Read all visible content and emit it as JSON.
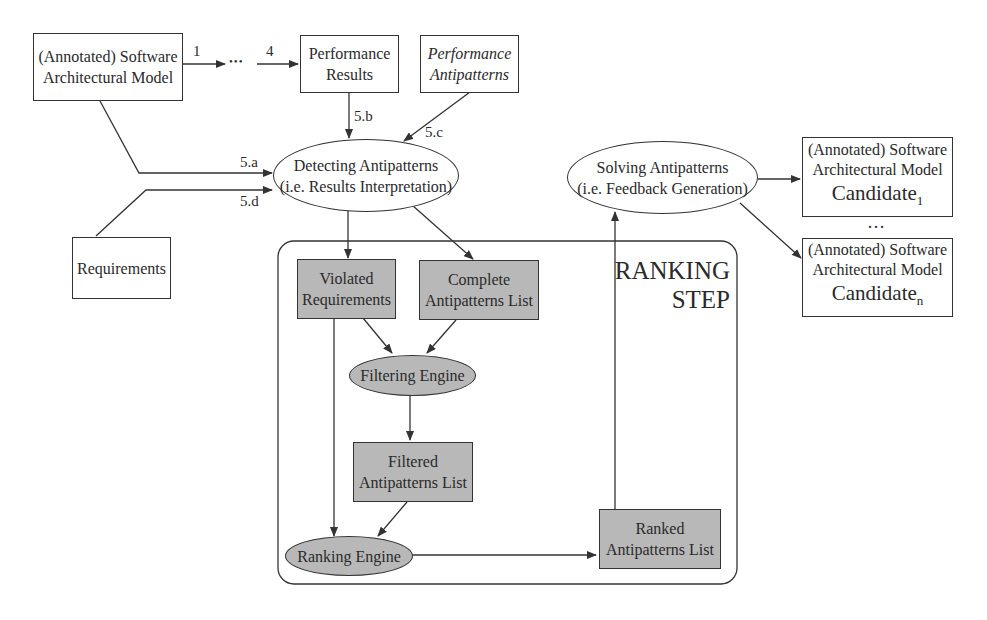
{
  "nodes": {
    "model": {
      "line1": "(Annotated) Software",
      "line2": "Architectural Model"
    },
    "perf_results": {
      "line1": "Performance",
      "line2": "Results"
    },
    "perf_antipatterns": {
      "line1": "Performance",
      "line2": "Antipatterns"
    },
    "detecting": {
      "line1": "Detecting Antipatterns",
      "line2": "(i.e. Results Interpretation)"
    },
    "requirements": {
      "label": "Requirements"
    },
    "solving": {
      "line1": "Solving Antipatterns",
      "line2": "(i.e. Feedback Generation)"
    },
    "candidate1": {
      "line1": "(Annotated) Software",
      "line2": "Architectural Model",
      "name": "Candidate",
      "sub": "1"
    },
    "candidaten": {
      "line1": "(Annotated) Software",
      "line2": "Architectural Model",
      "name": "Candidate",
      "sub": "n"
    },
    "candidate_ellipsis": "…",
    "violated": {
      "line1": "Violated",
      "line2": "Requirements"
    },
    "complete": {
      "line1": "Complete",
      "line2": "Antipatterns List"
    },
    "filtering": {
      "label": "Filtering Engine"
    },
    "filtered": {
      "line1": "Filtered",
      "line2": "Antipatterns List"
    },
    "ranking_engine": {
      "label": "Ranking Engine"
    },
    "ranked": {
      "line1": "Ranked",
      "line2": "Antipatterns List"
    },
    "ranking_step": {
      "line1": "RANKING",
      "line2": "STEP"
    }
  },
  "edge_labels": {
    "step1": "1",
    "step4": "4",
    "ellipsis": "•••",
    "a": "5.a",
    "b": "5.b",
    "c": "5.c",
    "d": "5.d"
  },
  "colors": {
    "process_fill": "#b8b8b8",
    "stroke": "#333333"
  }
}
